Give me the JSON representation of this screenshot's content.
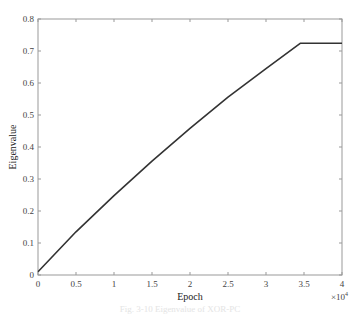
{
  "chart_data": {
    "type": "line",
    "title": "",
    "xlabel": "Epoch",
    "ylabel": "Eigenvalue",
    "x_multiplier_label": "×10",
    "x_multiplier_exponent": "4",
    "xlim": [
      0,
      4
    ],
    "ylim": [
      0,
      0.8
    ],
    "xticks": [
      "0",
      "0.5",
      "1",
      "1.5",
      "2",
      "2.5",
      "3",
      "3.5",
      "4"
    ],
    "yticks": [
      "0",
      "0.1",
      "0.2",
      "0.3",
      "0.4",
      "0.5",
      "0.6",
      "0.7",
      "0.8"
    ],
    "grid": false,
    "series": [
      {
        "name": "Eigenvalue",
        "color": "#333333",
        "x": [
          0,
          0.5,
          1.0,
          1.5,
          2.0,
          2.5,
          3.0,
          3.45,
          4.0
        ],
        "y": [
          0.01,
          0.135,
          0.248,
          0.356,
          0.458,
          0.556,
          0.645,
          0.724,
          0.724
        ]
      }
    ],
    "caption": "Fig. 3-10  Eigenvalue of XOR-PC"
  }
}
